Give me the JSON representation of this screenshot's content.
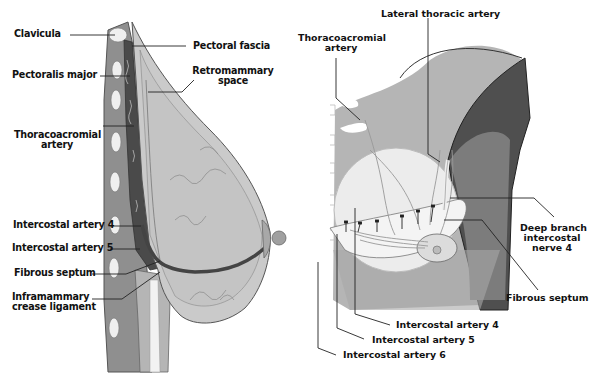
{
  "left_diagram": {
    "name": "Sagittal section of breast",
    "labels": {
      "clavicula": "Clavicula",
      "pectoralis_major": "Pectoralis major",
      "thoracoacromial_artery_1": "Thoracoacromial",
      "thoracoacromial_artery_2": "artery",
      "pectoral_fascia": "Pectoral fascia",
      "retromammary_space_1": "Retromammary",
      "retromammary_space_2": "space",
      "intercostal_artery_4": "Intercostal artery  4",
      "intercostal_artery_5": "Intercostal artery  5",
      "fibrous_septum": "Fibrous septum",
      "inframammary_crease_ligament_1": "Inframammary",
      "inframammary_crease_ligament_2": "crease ligament"
    }
  },
  "right_diagram": {
    "name": "Anterior view of chest and breast vasculature",
    "labels": {
      "lateral_thoracic_artery": "Lateral thoracic artery",
      "thoracoacromial_artery_1": "Thoracoacromial",
      "thoracoacromial_artery_2": "artery",
      "deep_branch_1": "Deep branch",
      "deep_branch_2": "intercostal",
      "deep_branch_3": "nerve  4",
      "fibrous_septum": "Fibrous septum",
      "intercostal_artery_4": "Intercostal artery  4",
      "intercostal_artery_5": "Intercostal artery  5",
      "intercostal_artery_6": "Intercostal artery  6"
    }
  },
  "colors": {
    "background": "#ffffff",
    "gland": "#c9c9c9",
    "skin_outline": "#555555",
    "muscle_dark": "#4a4a4a",
    "rib": "#f0f0f0",
    "chest_wall": "#8a8a8a",
    "arm_dark": "#505050",
    "leader_line": "#222222"
  }
}
